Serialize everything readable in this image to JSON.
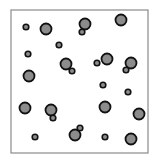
{
  "diagram": {
    "colors": {
      "background": "#ffffff",
      "frame": "#8a8a8a",
      "particle_fill": "#8c8c8c",
      "particle_stroke": "#111111"
    },
    "frame": {
      "x": 11,
      "y": 10,
      "width": 137,
      "height": 143
    },
    "particle_radius": {
      "large": 5.5,
      "small": 2.8
    },
    "particles": [
      {
        "x": 26,
        "y": 27,
        "size": "small"
      },
      {
        "x": 46,
        "y": 29,
        "size": "large"
      },
      {
        "x": 85,
        "y": 24,
        "size": "large"
      },
      {
        "x": 82,
        "y": 32,
        "size": "small"
      },
      {
        "x": 121,
        "y": 20,
        "size": "large"
      },
      {
        "x": 59,
        "y": 45,
        "size": "small"
      },
      {
        "x": 28,
        "y": 54,
        "size": "small"
      },
      {
        "x": 66,
        "y": 64,
        "size": "large"
      },
      {
        "x": 72,
        "y": 71,
        "size": "small"
      },
      {
        "x": 97,
        "y": 63,
        "size": "small"
      },
      {
        "x": 107,
        "y": 59,
        "size": "large"
      },
      {
        "x": 131,
        "y": 63,
        "size": "large"
      },
      {
        "x": 126,
        "y": 70,
        "size": "small"
      },
      {
        "x": 29,
        "y": 76,
        "size": "large"
      },
      {
        "x": 103,
        "y": 85,
        "size": "small"
      },
      {
        "x": 128,
        "y": 92,
        "size": "small"
      },
      {
        "x": 25,
        "y": 108,
        "size": "large"
      },
      {
        "x": 51,
        "y": 110,
        "size": "large"
      },
      {
        "x": 53,
        "y": 118,
        "size": "small"
      },
      {
        "x": 105,
        "y": 107,
        "size": "large"
      },
      {
        "x": 139,
        "y": 114,
        "size": "large"
      },
      {
        "x": 35,
        "y": 137,
        "size": "small"
      },
      {
        "x": 75,
        "y": 135,
        "size": "large"
      },
      {
        "x": 80,
        "y": 128,
        "size": "small"
      },
      {
        "x": 105,
        "y": 137,
        "size": "small"
      },
      {
        "x": 131,
        "y": 139,
        "size": "large"
      }
    ]
  }
}
